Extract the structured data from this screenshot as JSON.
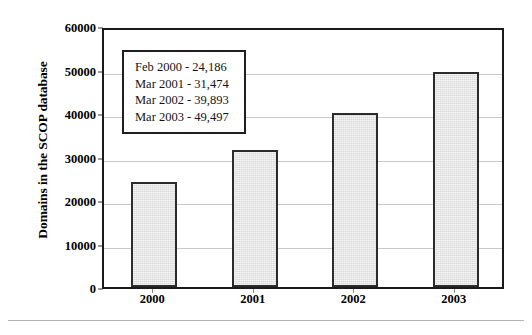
{
  "chart_data": {
    "type": "bar",
    "title": "",
    "xlabel": "",
    "ylabel": "Domains in the SCOP database",
    "categories": [
      "2000",
      "2001",
      "2002",
      "2003"
    ],
    "values": [
      24186,
      31474,
      39893,
      49497
    ],
    "ylim": [
      0,
      60000
    ],
    "ytick_labels": [
      "0",
      "10000",
      "20000",
      "30000",
      "40000",
      "50000",
      "60000"
    ],
    "ytick_values": [
      0,
      10000,
      20000,
      30000,
      40000,
      50000,
      60000
    ],
    "grid": true,
    "legend_position": "inside-upper-left",
    "annotations": [
      "Feb 2000 - 24,186",
      "Mar 2001 - 31,474",
      "Mar 2002 - 39,893",
      "Mar 2003 - 49,497"
    ],
    "colors": {
      "bar_fill": "#d9d9d9",
      "bar_edge": "#2b2b2b",
      "axis": "#1a1a1a",
      "gridline": "#c9c9c9",
      "text": "#000000"
    }
  }
}
